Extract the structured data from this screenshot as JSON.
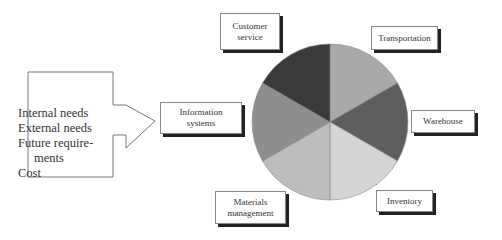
{
  "input_panel": {
    "items": [
      "Internal needs",
      "External needs",
      "Future require-",
      "ments",
      "Cost"
    ]
  },
  "pie": {
    "slices": [
      {
        "label": "Transportation",
        "color": "#a9a9a9"
      },
      {
        "label": "Warehouse",
        "color": "#5a5a5a"
      },
      {
        "label": "Inventory",
        "color": "#d2d2d2"
      },
      {
        "label": "Materials management",
        "color": "#bcbcbc"
      },
      {
        "label": "Information systems",
        "color": "#8c8c8c"
      },
      {
        "label": "Customer service",
        "color": "#3a3a3a"
      }
    ]
  },
  "labels": {
    "customer_service": [
      "Customer",
      "service"
    ],
    "transportation": "Transportation",
    "information_systems": [
      "Information",
      "systems"
    ],
    "warehouse": "Warehouse",
    "materials_management": [
      "Materials",
      "management"
    ],
    "inventory": "Inventory"
  }
}
